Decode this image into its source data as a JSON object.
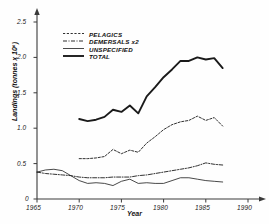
{
  "chart_data": {
    "type": "line",
    "title": "",
    "xlabel": "Year",
    "ylabel": "Landings (tonnes x 10⁶)",
    "xlim": [
      1965,
      1990
    ],
    "ylim": [
      0,
      2.6
    ],
    "xticks": [
      "1965",
      "1970",
      "1975",
      "1980",
      "1985",
      "1990"
    ],
    "yticks": [
      "0",
      "0.5",
      "1.0",
      "1.5",
      "2.0",
      "2.5"
    ],
    "grid": false,
    "legend_position": "upper-left",
    "series": [
      {
        "name": "PELAGICS",
        "style": "dashed",
        "color": "#1a1a1a",
        "x": [
          1970,
          1971,
          1972,
          1973,
          1974,
          1975,
          1976,
          1977,
          1978,
          1979,
          1980,
          1981,
          1982,
          1983,
          1984,
          1985,
          1986,
          1987
        ],
        "values": [
          0.57,
          0.57,
          0.58,
          0.6,
          0.7,
          0.64,
          0.69,
          0.66,
          0.79,
          0.88,
          0.98,
          1.05,
          1.09,
          1.11,
          1.17,
          1.11,
          1.15,
          1.03
        ]
      },
      {
        "name": "DEMERSALS x2",
        "style": "dash-dot",
        "color": "#1a1a1a",
        "x": [
          1965,
          1966,
          1967,
          1968,
          1969,
          1970,
          1971,
          1972,
          1973,
          1974,
          1975,
          1976,
          1977,
          1978,
          1979,
          1980,
          1981,
          1982,
          1983,
          1984,
          1985,
          1986,
          1987
        ],
        "values": [
          0.38,
          0.36,
          0.35,
          0.34,
          0.33,
          0.31,
          0.3,
          0.3,
          0.3,
          0.31,
          0.31,
          0.31,
          0.33,
          0.34,
          0.36,
          0.38,
          0.4,
          0.42,
          0.44,
          0.47,
          0.51,
          0.49,
          0.48
        ]
      },
      {
        "name": "UNSPECIFIED",
        "style": "solid-thin",
        "color": "#1a1a1a",
        "x": [
          1965,
          1966,
          1967,
          1968,
          1969,
          1970,
          1971,
          1972,
          1973,
          1974,
          1975,
          1976,
          1977,
          1978,
          1979,
          1980,
          1981,
          1982,
          1983,
          1984,
          1985,
          1986,
          1987
        ],
        "values": [
          0.38,
          0.41,
          0.42,
          0.4,
          0.33,
          0.26,
          0.22,
          0.23,
          0.22,
          0.19,
          0.25,
          0.28,
          0.22,
          0.23,
          0.22,
          0.22,
          0.26,
          0.3,
          0.3,
          0.28,
          0.26,
          0.25,
          0.24
        ]
      },
      {
        "name": "TOTAL",
        "style": "solid-thick",
        "color": "#1a1a1a",
        "x": [
          1970,
          1971,
          1972,
          1973,
          1974,
          1975,
          1976,
          1977,
          1978,
          1979,
          1980,
          1981,
          1982,
          1983,
          1984,
          1985,
          1986,
          1987
        ],
        "values": [
          1.13,
          1.1,
          1.12,
          1.16,
          1.26,
          1.23,
          1.32,
          1.21,
          1.45,
          1.58,
          1.72,
          1.83,
          1.95,
          1.95,
          2.0,
          1.97,
          1.99,
          1.85
        ]
      }
    ]
  },
  "axes": {
    "y_title": "Landings (tonnes x 10⁶)",
    "x_title": "Year",
    "y_tick_labels": [
      "2.5",
      "2.0",
      "1.5",
      "1.0",
      "0.5",
      "0"
    ],
    "x_tick_labels": [
      "1965",
      "1970",
      "1975",
      "1980",
      "1985",
      "1990"
    ]
  },
  "legend": {
    "entries": [
      {
        "label": "PELAGICS",
        "style": "dashed"
      },
      {
        "label": "DEMERSALS x2",
        "style": "dash-dot"
      },
      {
        "label": "UNSPECIFIED",
        "style": "solid-thin"
      },
      {
        "label": "TOTAL",
        "style": "solid-thick"
      }
    ]
  }
}
